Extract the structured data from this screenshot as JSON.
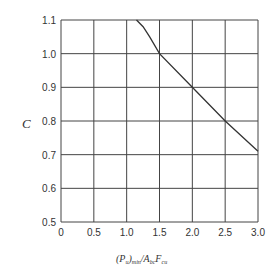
{
  "chart_data": {
    "type": "line",
    "title": "",
    "xlabel": "(P_u)min/A_bc F_cu",
    "ylabel": "C",
    "xlim": [
      0,
      3.0
    ],
    "ylim": [
      0.5,
      1.1
    ],
    "grid": true,
    "legend": "none",
    "x_ticks": [
      "0",
      "0.5",
      "1.0",
      "1.5",
      "2.0",
      "2.5",
      "3.0"
    ],
    "y_ticks": [
      "0.5",
      "0.6",
      "0.7",
      "0.8",
      "0.9",
      "1.0",
      "1.1"
    ],
    "series": [
      {
        "name": "C",
        "x": [
          1.15,
          1.25,
          1.35,
          1.5,
          2.0,
          2.5,
          3.0
        ],
        "y": [
          1.1,
          1.08,
          1.05,
          1.0,
          0.9,
          0.8,
          0.71
        ]
      }
    ]
  },
  "labels": {
    "y_axis": "C",
    "x_axis_main": "(P",
    "x_axis_sub1": "u",
    "x_axis_mid": ")",
    "x_axis_sub2": "min",
    "x_axis_slash": "/A",
    "x_axis_sub3": "bc",
    "x_axis_f": "F",
    "x_axis_sub4": "cu"
  }
}
